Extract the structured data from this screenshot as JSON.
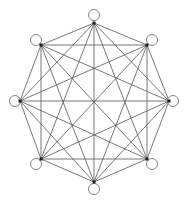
{
  "diagram": {
    "type": "complete-graph",
    "name": "K8",
    "vertex_count": 8,
    "colors": {
      "edge": "#555555",
      "vertex_dot": "#222222",
      "circle_stroke": "#777777",
      "background": "#ffffff"
    },
    "vertices": [
      {
        "id": "top",
        "x": 94,
        "y": 23,
        "cx": 94,
        "cy": 15
      },
      {
        "id": "top-right",
        "x": 147,
        "y": 45,
        "cx": 152,
        "cy": 40
      },
      {
        "id": "right",
        "x": 169,
        "y": 101,
        "cx": 173,
        "cy": 101
      },
      {
        "id": "bottom-right",
        "x": 147,
        "y": 159,
        "cx": 152,
        "cy": 164
      },
      {
        "id": "bottom",
        "x": 94,
        "y": 182,
        "cx": 94,
        "cy": 189
      },
      {
        "id": "bottom-left",
        "x": 41,
        "y": 159,
        "cx": 36,
        "cy": 164
      },
      {
        "id": "left",
        "x": 20,
        "y": 101,
        "cx": 15,
        "cy": 101
      },
      {
        "id": "top-left",
        "x": 41,
        "y": 45,
        "cx": 36,
        "cy": 40
      }
    ]
  }
}
